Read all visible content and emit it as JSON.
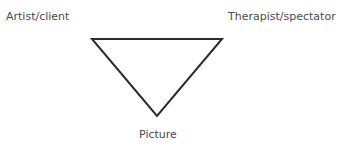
{
  "diagram": {
    "type": "triangle",
    "nodes": {
      "top_left": "Artist/client",
      "top_right": "Therapist/spectator",
      "bottom": "Picture"
    },
    "colors": {
      "line": "#2b2b2b",
      "text": "#4a4a4a",
      "background": "#ffffff"
    }
  }
}
